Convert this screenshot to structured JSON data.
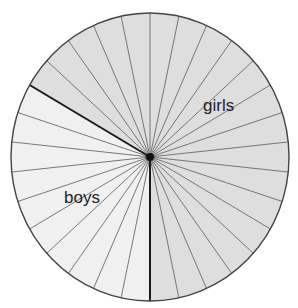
{
  "chart_data": {
    "type": "pie",
    "title": "",
    "total_slices": 30,
    "slice_angle_deg": 12,
    "categories": [
      "girls",
      "boys"
    ],
    "values": [
      20,
      10
    ],
    "fractions": [
      "2/3",
      "1/3"
    ],
    "series": [
      {
        "name": "girls",
        "slices": 20,
        "start_deg": 300,
        "end_deg": 540,
        "color": "#dedede"
      },
      {
        "name": "boys",
        "slices": 10,
        "start_deg": 180,
        "end_deg": 300,
        "color": "#f0f0f0"
      }
    ],
    "labels": {
      "girls": {
        "text": "girls",
        "x": 203,
        "y": 111
      },
      "boys": {
        "text": "boys",
        "x": 64,
        "y": 203
      }
    },
    "legend": "none"
  },
  "colors": {
    "outline": "#444444",
    "divider": "#1a1a1a",
    "slice_line": "#6a6a6a",
    "center_dot": "#111111"
  },
  "geometry": {
    "cx": 150,
    "cy": 157,
    "rx": 139,
    "ry": 144
  }
}
